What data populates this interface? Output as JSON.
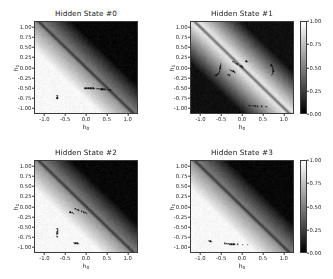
{
  "figure": {
    "background": "#ffffff",
    "width": 333,
    "height": 279
  },
  "chart_data": {
    "type": "heatmap",
    "title": "",
    "xlabel": "h_0",
    "ylabel": "h_1",
    "xlabel_base": "h",
    "xlabel_sub": "0",
    "ylabel_base": "h",
    "ylabel_sub": "1",
    "xlim": [
      -1.25,
      1.25
    ],
    "ylim": [
      -1.15,
      1.15
    ],
    "xticks": [
      "-1.0",
      "-0.5",
      "0.0",
      "0.5",
      "1.0"
    ],
    "xtick_values": [
      -1.0,
      -0.5,
      0.0,
      0.5,
      1.0
    ],
    "yticks": [
      "1.00",
      "0.75",
      "0.50",
      "0.25",
      "0.00",
      "-0.25",
      "-0.50",
      "-0.75",
      "-1.00"
    ],
    "ytick_values": [
      1.0,
      0.75,
      0.5,
      0.25,
      0.0,
      -0.25,
      -0.5,
      -0.75,
      -1.0
    ],
    "colormap": "gray",
    "colorbar": {
      "ticks": [
        "1.00",
        "0.75",
        "0.50",
        "0.25",
        "0.00"
      ],
      "tick_values": [
        1.0,
        0.75,
        0.5,
        0.25,
        0.0
      ],
      "vmin": 0.0,
      "vmax": 1.0,
      "position": "right"
    },
    "grid": false,
    "legend": false,
    "panels": [
      {
        "id": 0,
        "title": "Hidden State #0",
        "row": 0,
        "col": 0,
        "gradient_angle_deg": 135,
        "field_high_corner": "lower-left",
        "field_low_corner": "upper-right",
        "boundary_line": "anti-diagonal",
        "points": [
          [
            0.04,
            0.63
          ],
          [
            0.07,
            0.64
          ],
          [
            0.09,
            0.66
          ],
          [
            0.12,
            0.67
          ],
          [
            0.14,
            0.69
          ],
          [
            0.17,
            0.7
          ],
          [
            0.21,
            0.71
          ],
          [
            0.24,
            0.71
          ],
          [
            0.27,
            0.72
          ],
          [
            0.3,
            0.72
          ],
          [
            0.69,
            0.33
          ],
          [
            0.71,
            0.3
          ],
          [
            0.72,
            0.26
          ],
          [
            0.73,
            0.23
          ],
          [
            0.74,
            0.2
          ],
          [
            -0.7,
            -0.72
          ],
          [
            -0.69,
            -0.74
          ],
          [
            -0.71,
            -0.76
          ],
          [
            -0.7,
            -0.78
          ],
          [
            -0.02,
            -0.52
          ],
          [
            0.02,
            -0.52
          ],
          [
            0.06,
            -0.52
          ],
          [
            0.1,
            -0.53
          ],
          [
            0.14,
            -0.53
          ],
          [
            0.18,
            -0.53
          ],
          [
            0.22,
            -0.54
          ],
          [
            0.26,
            -0.54
          ],
          [
            0.3,
            -0.54
          ],
          [
            0.34,
            -0.54
          ],
          [
            0.37,
            -0.55
          ],
          [
            0.4,
            -0.55
          ],
          [
            0.43,
            -0.55
          ],
          [
            0.46,
            -0.55
          ],
          [
            0.49,
            -0.56
          ],
          [
            0.53,
            -0.56
          ],
          [
            0.57,
            -0.56
          ],
          [
            0.61,
            -0.57
          ]
        ]
      },
      {
        "id": 1,
        "title": "Hidden State #1",
        "row": 0,
        "col": 1,
        "gradient_angle_deg": 135,
        "field_high_corner": "band-diagonal",
        "field_low_corner": "corners",
        "boundary_line": "anti-diagonal",
        "points": [
          [
            0.66,
            0.88
          ],
          [
            0.69,
            0.86
          ],
          [
            -0.52,
            0.1
          ],
          [
            -0.52,
            0.06
          ],
          [
            -0.53,
            0.02
          ],
          [
            -0.53,
            -0.02
          ],
          [
            -0.54,
            -0.06
          ],
          [
            -0.55,
            -0.1
          ],
          [
            -0.57,
            -0.14
          ],
          [
            -0.6,
            -0.17
          ],
          [
            -0.63,
            -0.19
          ],
          [
            -0.67,
            -0.21
          ],
          [
            -0.22,
            0.14
          ],
          [
            -0.18,
            0.12
          ],
          [
            -0.14,
            0.1
          ],
          [
            -0.1,
            0.08
          ],
          [
            -0.06,
            0.05
          ],
          [
            -0.02,
            0.03
          ],
          [
            0.02,
            0.01
          ],
          [
            -0.3,
            -0.06
          ],
          [
            -0.26,
            -0.08
          ],
          [
            -0.22,
            -0.1
          ],
          [
            -0.18,
            -0.12
          ],
          [
            -0.34,
            -0.18
          ],
          [
            -0.3,
            -0.2
          ],
          [
            0.1,
            0.16
          ],
          [
            0.14,
            0.14
          ],
          [
            0.72,
            0.06
          ],
          [
            0.74,
            0.02
          ],
          [
            0.75,
            -0.02
          ],
          [
            0.76,
            -0.06
          ],
          [
            0.76,
            -0.1
          ],
          [
            0.75,
            -0.14
          ],
          [
            0.73,
            -0.18
          ],
          [
            -0.86,
            -0.96
          ],
          [
            -0.82,
            -0.96
          ],
          [
            -0.78,
            -0.97
          ],
          [
            0.18,
            -0.97
          ],
          [
            0.22,
            -0.97
          ],
          [
            0.26,
            -0.97
          ],
          [
            0.3,
            -0.97
          ],
          [
            0.34,
            -0.98
          ],
          [
            0.38,
            -0.98
          ],
          [
            0.48,
            -0.98
          ],
          [
            0.6,
            -0.99
          ]
        ]
      },
      {
        "id": 2,
        "title": "Hidden State #2",
        "row": 1,
        "col": 0,
        "gradient_angle_deg": 135,
        "field_high_corner": "lower-left",
        "field_low_corner": "upper-right",
        "boundary_line": "anti-diagonal",
        "points": [
          [
            0.28,
            1.02
          ],
          [
            0.32,
            1.02
          ],
          [
            0.36,
            1.03
          ],
          [
            0.68,
            0.82
          ],
          [
            0.7,
            0.78
          ],
          [
            0.72,
            0.74
          ],
          [
            0.73,
            0.7
          ],
          [
            0.74,
            0.66
          ],
          [
            0.75,
            0.62
          ],
          [
            0.76,
            0.58
          ],
          [
            0.76,
            0.54
          ],
          [
            0.77,
            0.5
          ],
          [
            0.77,
            0.46
          ],
          [
            0.78,
            0.42
          ],
          [
            0.78,
            0.38
          ],
          [
            0.78,
            0.34
          ],
          [
            0.79,
            0.3
          ],
          [
            0.79,
            0.26
          ],
          [
            0.8,
            0.22
          ],
          [
            0.8,
            0.18
          ],
          [
            0.81,
            0.12
          ],
          [
            0.82,
            0.06
          ],
          [
            -0.26,
            -0.06
          ],
          [
            -0.22,
            -0.08
          ],
          [
            -0.18,
            -0.1
          ],
          [
            -0.38,
            -0.14
          ],
          [
            -0.34,
            -0.16
          ],
          [
            -0.3,
            -0.18
          ],
          [
            -0.1,
            -0.12
          ],
          [
            -0.06,
            -0.14
          ],
          [
            -0.02,
            -0.16
          ],
          [
            0.02,
            -0.18
          ],
          [
            -0.7,
            -0.56
          ],
          [
            -0.69,
            -0.6
          ],
          [
            -0.7,
            -0.64
          ],
          [
            -0.71,
            -0.68
          ],
          [
            -0.72,
            -0.72
          ],
          [
            -0.71,
            -0.76
          ],
          [
            -0.3,
            -0.92
          ],
          [
            -0.26,
            -0.93
          ],
          [
            -0.22,
            -0.93
          ],
          [
            -0.18,
            -0.94
          ]
        ]
      },
      {
        "id": 3,
        "title": "Hidden State #3",
        "row": 1,
        "col": 1,
        "gradient_angle_deg": 135,
        "field_high_corner": "lower-left",
        "field_low_corner": "upper-right",
        "boundary_line": "anti-diagonal",
        "points": [
          [
            0.36,
            0.92
          ],
          [
            0.4,
            0.93
          ],
          [
            0.44,
            0.93
          ],
          [
            0.48,
            0.94
          ],
          [
            0.62,
            0.86
          ],
          [
            0.66,
            0.84
          ],
          [
            0.7,
            0.82
          ],
          [
            0.74,
            0.8
          ],
          [
            0.78,
            0.78
          ],
          [
            0.82,
            0.76
          ],
          [
            0.88,
            0.72
          ],
          [
            0.92,
            0.7
          ],
          [
            -0.82,
            -0.86
          ],
          [
            -0.78,
            -0.88
          ],
          [
            -0.74,
            -0.89
          ],
          [
            -0.42,
            -0.93
          ],
          [
            -0.38,
            -0.94
          ],
          [
            -0.34,
            -0.94
          ],
          [
            -0.3,
            -0.95
          ],
          [
            -0.26,
            -0.95
          ],
          [
            -0.22,
            -0.95
          ],
          [
            -0.18,
            -0.96
          ],
          [
            -0.1,
            -0.96
          ],
          [
            0.02,
            -0.97
          ],
          [
            0.14,
            -0.97
          ]
        ]
      }
    ]
  }
}
